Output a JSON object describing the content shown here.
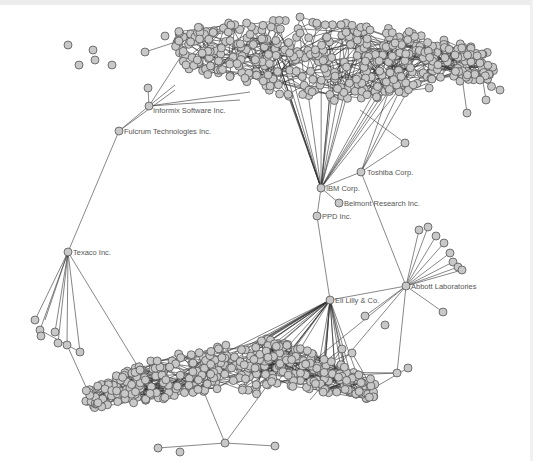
{
  "diagram": {
    "type": "network",
    "colors": {
      "background": "#ffffff",
      "node_fill": "#c8c8c8",
      "node_stroke": "#555555",
      "edge": "#333333",
      "label": "#555555"
    },
    "labeled_nodes": [
      {
        "id": "informix",
        "label": "Informix Software Inc.",
        "x": 149,
        "y": 106
      },
      {
        "id": "fulcrum",
        "label": "Fulcrum Technologies Inc.",
        "x": 119,
        "y": 131
      },
      {
        "id": "texaco",
        "label": "Texaco Inc.",
        "x": 68,
        "y": 252
      },
      {
        "id": "toshiba",
        "label": "Toshiba Corp.",
        "x": 361,
        "y": 172
      },
      {
        "id": "ibm",
        "label": "IBM Corp.",
        "x": 321,
        "y": 188
      },
      {
        "id": "belmont",
        "label": "Belmont Research Inc.",
        "x": 339,
        "y": 203
      },
      {
        "id": "ppd",
        "label": "PPD Inc.",
        "x": 317,
        "y": 216
      },
      {
        "id": "lilly",
        "label": "Eli Lilly & Co.",
        "x": 330,
        "y": 300
      },
      {
        "id": "abbott",
        "label": "Abbott Laboratories",
        "x": 406,
        "y": 286
      }
    ],
    "bridge_edges": [
      [
        "informix",
        "fulcrum"
      ],
      [
        "fulcrum",
        "texaco"
      ],
      [
        "ibm",
        "belmont"
      ],
      [
        "ibm",
        "ppd"
      ],
      [
        "ibm",
        "toshiba"
      ],
      [
        "ppd",
        "lilly"
      ],
      [
        "toshiba",
        "abbott"
      ],
      [
        "abbott",
        "lilly"
      ]
    ],
    "clusters": [
      {
        "name": "top-cluster",
        "cx": 330,
        "cy": 75,
        "rx": 150,
        "ry": 38,
        "count": 420,
        "hub": "ibm"
      },
      {
        "name": "bottom-cluster",
        "cx": 245,
        "cy": 395,
        "rx": 150,
        "ry": 35,
        "count": 380,
        "hub": "lilly"
      }
    ],
    "abbott_spokes": [
      [
        419,
        230
      ],
      [
        428,
        227
      ],
      [
        436,
        236
      ],
      [
        444,
        243
      ],
      [
        450,
        253
      ],
      [
        453,
        262
      ],
      [
        458,
        267
      ],
      [
        462,
        270
      ]
    ]
  }
}
